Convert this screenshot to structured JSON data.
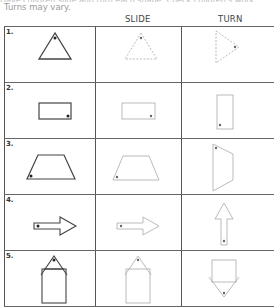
{
  "header": {
    "cutoff_text": "Have children slide and turn each shape. Check children's work.",
    "note": "Turns may vary.",
    "columns": [
      "",
      "SLIDE",
      "TURN"
    ]
  },
  "rows": [
    {
      "number": "1.",
      "shape": "triangle"
    },
    {
      "number": "2.",
      "shape": "rectangle"
    },
    {
      "number": "3.",
      "shape": "trapezoid"
    },
    {
      "number": "4.",
      "shape": "arrow"
    },
    {
      "number": "5.",
      "shape": "house"
    }
  ],
  "colors": {
    "original_stroke": "#444444",
    "traced_stroke": "#aaaaaa",
    "grid": "#666666"
  }
}
